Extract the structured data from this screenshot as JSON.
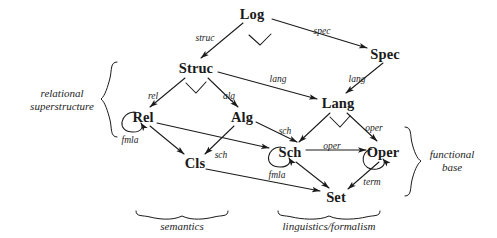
{
  "diagram": {
    "ink_color": "#1a1a1a",
    "background_color": "#ffffff",
    "nodes": [
      {
        "id": "log",
        "label": "Log",
        "x": 252,
        "y": 14
      },
      {
        "id": "spec",
        "label": "Spec",
        "x": 385,
        "y": 54
      },
      {
        "id": "struc",
        "label": "Struc",
        "x": 196,
        "y": 68
      },
      {
        "id": "lang",
        "label": "Lang",
        "x": 338,
        "y": 103
      },
      {
        "id": "rel",
        "label": "Rel",
        "x": 143,
        "y": 117
      },
      {
        "id": "alg",
        "label": "Alg",
        "x": 242,
        "y": 117
      },
      {
        "id": "sch",
        "label": "Sch",
        "x": 290,
        "y": 152
      },
      {
        "id": "oper",
        "label": "Oper",
        "x": 383,
        "y": 152
      },
      {
        "id": "cls",
        "label": "Cls",
        "x": 195,
        "y": 163
      },
      {
        "id": "set",
        "label": "Set",
        "x": 336,
        "y": 197
      }
    ],
    "edges": [
      {
        "id": "log-struc",
        "from": "Log",
        "to": "Struc",
        "label": "struc",
        "label_x": 205,
        "label_y": 38
      },
      {
        "id": "log-spec",
        "from": "Log",
        "to": "Spec",
        "label": "spec",
        "label_x": 322,
        "label_y": 31
      },
      {
        "id": "struc-rel",
        "from": "Struc",
        "to": "Rel",
        "label": "rel",
        "label_x": 153,
        "label_y": 96
      },
      {
        "id": "struc-alg",
        "from": "Struc",
        "to": "Alg",
        "label": "alg",
        "label_x": 229,
        "label_y": 96
      },
      {
        "id": "struc-lang",
        "from": "Struc",
        "to": "Lang",
        "label": "lang",
        "label_x": 278,
        "label_y": 79
      },
      {
        "id": "spec-lang",
        "from": "Spec",
        "to": "Lang",
        "label": "lang",
        "label_x": 357,
        "label_y": 79
      },
      {
        "id": "rel-cls",
        "from": "Rel",
        "to": "Cls",
        "label": "",
        "label_x": 0,
        "label_y": 0
      },
      {
        "id": "rel-sch",
        "from": "Rel",
        "to": "Sch",
        "label": "sch",
        "label_x": 221,
        "label_y": 155
      },
      {
        "id": "alg-cls",
        "from": "Alg",
        "to": "Cls",
        "label": "",
        "label_x": 0,
        "label_y": 0
      },
      {
        "id": "alg-sch",
        "from": "Alg",
        "to": "Sch",
        "label": "sch",
        "label_x": 285,
        "label_y": 131
      },
      {
        "id": "lang-sch",
        "from": "Lang",
        "to": "Sch",
        "label": "",
        "label_x": 0,
        "label_y": 0
      },
      {
        "id": "lang-oper",
        "from": "Lang",
        "to": "Oper",
        "label": "oper",
        "label_x": 374,
        "label_y": 128
      },
      {
        "id": "sch-oper",
        "from": "Sch",
        "to": "Oper",
        "label": "oper",
        "label_x": 332,
        "label_y": 146
      },
      {
        "id": "cls-set",
        "from": "Cls",
        "to": "Set",
        "label": "",
        "label_x": 0,
        "label_y": 0
      },
      {
        "id": "sch-set",
        "from": "Sch",
        "to": "Set",
        "label": "",
        "label_x": 0,
        "label_y": 0
      },
      {
        "id": "oper-set",
        "from": "Oper",
        "to": "Set",
        "label": "term",
        "label_x": 372,
        "label_y": 182
      }
    ],
    "loops": [
      {
        "id": "rel-loop",
        "node": "Rel",
        "label": "fmla",
        "label_x": 130,
        "label_y": 140
      },
      {
        "id": "sch-loop",
        "node": "Sch",
        "label": "fmla",
        "label_x": 277,
        "label_y": 175
      },
      {
        "id": "oper-loop",
        "node": "Oper",
        "label": "",
        "label_x": 0,
        "label_y": 0
      }
    ],
    "groups": [
      {
        "id": "relational-superstructure",
        "label": "relational\nsuperstructure",
        "label_line1": "relational",
        "label_line2": "superstructure",
        "brace": "left",
        "label_x": 62,
        "label_y": 100
      },
      {
        "id": "functional-base",
        "label": "functional\nbase",
        "label_line1": "functional",
        "label_line2": "base",
        "brace": "right",
        "label_x": 452,
        "label_y": 161
      },
      {
        "id": "semantics",
        "label": "semantics",
        "label_line1": "semantics",
        "label_line2": "",
        "brace": "bottom",
        "label_x": 182,
        "label_y": 226
      },
      {
        "id": "linguistics-formalism",
        "label": "linguistics/formalism",
        "label_line1": "linguistics/formalism",
        "label_line2": "",
        "brace": "bottom",
        "label_x": 329,
        "label_y": 226
      }
    ],
    "commuting_markers": [
      {
        "id": "marker-log",
        "x": 260,
        "y": 40
      },
      {
        "id": "marker-struc",
        "x": 196,
        "y": 88
      },
      {
        "id": "marker-lang",
        "x": 340,
        "y": 122
      }
    ]
  }
}
